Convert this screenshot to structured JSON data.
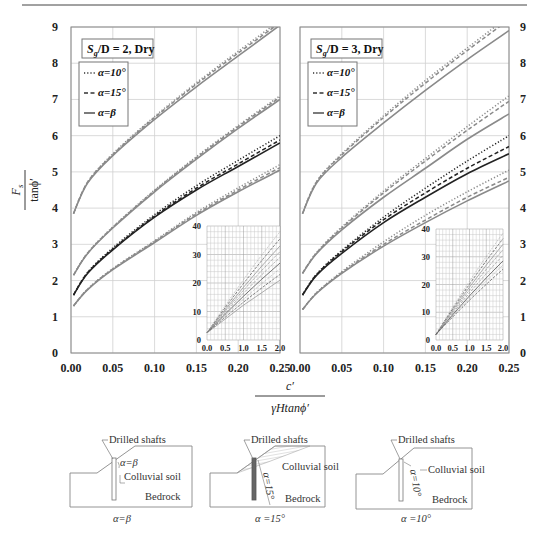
{
  "header_rule": true,
  "chart_data": [
    {
      "type": "line",
      "panel": "left",
      "title": "S_g/D = 2, Dry",
      "title_main": "S",
      "title_sub": "g",
      "title_rest": "/D = 2, Dry",
      "xlabel_num": "c′",
      "xlabel_den": "γHtanϕ′",
      "ylabel_num": "F_s",
      "ylabel_den": "tanϕ′",
      "xlim": [
        0,
        0.25
      ],
      "ylim": [
        0,
        9
      ],
      "xticks": [
        "0.00",
        "0.05",
        "0.10",
        "0.15",
        "0.20",
        "0.25"
      ],
      "yticks": [
        "0",
        "1",
        "2",
        "3",
        "4",
        "5",
        "6",
        "7",
        "8",
        "9"
      ],
      "grid": true,
      "legend": {
        "position": "upper-left",
        "items": [
          {
            "label": "α=10°",
            "style": "dotted"
          },
          {
            "label": "α=15°",
            "style": "dashed"
          },
          {
            "label": "α=β",
            "style": "solid"
          }
        ]
      },
      "x": [
        0.003,
        0.02,
        0.05,
        0.1,
        0.15,
        0.2,
        0.25
      ],
      "groups": [
        {
          "name": "curve-1",
          "color": "#8a8a8a",
          "series": [
            {
              "name": "α=β",
              "style": "solid",
              "values": [
                3.85,
                4.7,
                5.45,
                6.45,
                7.35,
                8.2,
                9.05
              ]
            },
            {
              "name": "α=15°",
              "style": "dashed",
              "values": [
                3.85,
                4.72,
                5.48,
                6.5,
                7.42,
                8.28,
                9.12
              ]
            },
            {
              "name": "α=10°",
              "style": "dotted",
              "values": [
                3.85,
                4.72,
                5.5,
                6.53,
                7.46,
                8.33,
                9.18
              ]
            }
          ]
        },
        {
          "name": "curve-2",
          "color": "#8a8a8a",
          "series": [
            {
              "name": "α=β",
              "style": "solid",
              "values": [
                2.15,
                2.75,
                3.45,
                4.45,
                5.35,
                6.2,
                7.0
              ]
            },
            {
              "name": "α=15°",
              "style": "dashed",
              "values": [
                2.15,
                2.76,
                3.47,
                4.48,
                5.39,
                6.25,
                7.06
              ]
            },
            {
              "name": "α=10°",
              "style": "dotted",
              "values": [
                2.15,
                2.77,
                3.48,
                4.5,
                5.42,
                6.28,
                7.1
              ]
            }
          ]
        },
        {
          "name": "curve-3",
          "color": "#222222",
          "series": [
            {
              "name": "α=β",
              "style": "solid",
              "values": [
                1.6,
                2.2,
                2.85,
                3.75,
                4.5,
                5.15,
                5.8
              ]
            },
            {
              "name": "α=15°",
              "style": "dashed",
              "values": [
                1.6,
                2.22,
                2.87,
                3.78,
                4.55,
                5.22,
                5.88
              ]
            },
            {
              "name": "α=10°",
              "style": "dotted",
              "values": [
                1.6,
                2.23,
                2.9,
                3.82,
                4.62,
                5.32,
                6.0
              ]
            }
          ]
        },
        {
          "name": "curve-4",
          "color": "#8a8a8a",
          "series": [
            {
              "name": "α=β",
              "style": "solid",
              "values": [
                1.3,
                1.75,
                2.3,
                3.05,
                3.8,
                4.45,
                5.05
              ]
            },
            {
              "name": "α=15°",
              "style": "dashed",
              "values": [
                1.3,
                1.76,
                2.32,
                3.08,
                3.84,
                4.5,
                5.12
              ]
            },
            {
              "name": "α=10°",
              "style": "dotted",
              "values": [
                1.3,
                1.77,
                2.33,
                3.1,
                3.88,
                4.56,
                5.2
              ]
            }
          ]
        }
      ],
      "inset": {
        "xlim": [
          0,
          2.0
        ],
        "ylim": [
          0,
          40
        ],
        "xticks": [
          "0.0",
          "0.5",
          "1.0",
          "1.5",
          "2.0"
        ],
        "yticks": [
          "0",
          "10",
          "20",
          "30",
          "40"
        ],
        "grid": "fine",
        "line_ends": [
          38,
          35.5,
          33,
          31,
          29,
          27,
          25,
          23,
          21
        ],
        "line_start": 2.5
      }
    },
    {
      "type": "line",
      "panel": "right",
      "title": "S_g/D = 3, Dry",
      "title_main": "S",
      "title_sub": "g",
      "title_rest": "/D = 3, Dry",
      "xlim": [
        0,
        0.25
      ],
      "ylim": [
        0,
        9
      ],
      "xticks": [
        "0.00",
        "0.05",
        "0.10",
        "0.15",
        "0.20",
        "0.25"
      ],
      "yticks": [
        "0",
        "1",
        "2",
        "3",
        "4",
        "5",
        "6",
        "7",
        "8",
        "9"
      ],
      "grid": true,
      "legend": {
        "position": "upper-left",
        "items": [
          {
            "label": "α=10°",
            "style": "dotted"
          },
          {
            "label": "α=15°",
            "style": "dashed"
          },
          {
            "label": "α=β",
            "style": "solid"
          }
        ]
      },
      "x": [
        0.003,
        0.02,
        0.05,
        0.1,
        0.15,
        0.2,
        0.25
      ],
      "groups": [
        {
          "name": "curve-1",
          "color": "#8a8a8a",
          "series": [
            {
              "name": "α=β",
              "style": "solid",
              "values": [
                3.85,
                4.7,
                5.4,
                6.35,
                7.25,
                8.1,
                8.9
              ]
            },
            {
              "name": "α=15°",
              "style": "dashed",
              "values": [
                3.85,
                4.73,
                5.47,
                6.5,
                7.45,
                8.35,
                9.2
              ]
            },
            {
              "name": "α=10°",
              "style": "dotted",
              "values": [
                3.85,
                4.74,
                5.5,
                6.55,
                7.52,
                8.42,
                9.3
              ]
            }
          ]
        },
        {
          "name": "curve-2",
          "color": "#8a8a8a",
          "series": [
            {
              "name": "α=β",
              "style": "solid",
              "values": [
                2.2,
                2.75,
                3.4,
                4.3,
                5.1,
                5.9,
                6.6
              ]
            },
            {
              "name": "α=15°",
              "style": "dashed",
              "values": [
                2.2,
                2.77,
                3.45,
                4.42,
                5.3,
                6.15,
                6.95
              ]
            },
            {
              "name": "α=10°",
              "style": "dotted",
              "values": [
                2.2,
                2.78,
                3.48,
                4.47,
                5.37,
                6.25,
                7.1
              ]
            }
          ]
        },
        {
          "name": "curve-3",
          "color": "#222222",
          "series": [
            {
              "name": "α=β",
              "style": "solid",
              "values": [
                1.6,
                2.15,
                2.75,
                3.6,
                4.3,
                4.95,
                5.5
              ]
            },
            {
              "name": "α=15°",
              "style": "dashed",
              "values": [
                1.6,
                2.17,
                2.8,
                3.68,
                4.42,
                5.1,
                5.7
              ]
            },
            {
              "name": "α=10°",
              "style": "dotted",
              "values": [
                1.6,
                2.18,
                2.83,
                3.75,
                4.55,
                5.3,
                6.0
              ]
            }
          ]
        },
        {
          "name": "curve-4",
          "color": "#8a8a8a",
          "series": [
            {
              "name": "α=β",
              "style": "solid",
              "values": [
                1.2,
                1.65,
                2.2,
                2.95,
                3.6,
                4.2,
                4.75
              ]
            },
            {
              "name": "α=15°",
              "style": "dashed",
              "values": [
                1.2,
                1.66,
                2.22,
                3.0,
                3.67,
                4.3,
                4.85
              ]
            },
            {
              "name": "α=10°",
              "style": "dotted",
              "values": [
                1.2,
                1.67,
                2.25,
                3.07,
                3.8,
                4.45,
                5.05
              ]
            }
          ]
        }
      ],
      "inset": {
        "xlim": [
          0,
          2.0
        ],
        "ylim": [
          0,
          40
        ],
        "xticks": [
          "0.0",
          "0.5",
          "1.0",
          "1.5",
          "2.0"
        ],
        "yticks": [
          "0",
          "10",
          "20",
          "30",
          "40"
        ],
        "grid": "fine",
        "line_ends": [
          38.5,
          36.5,
          34.5,
          32.5,
          30.5,
          28.5,
          27,
          25.5
        ],
        "line_start": 2.0
      }
    }
  ],
  "axes": {
    "ylabel_num_main": "F",
    "ylabel_num_sub": "s",
    "ylabel_den": "tanϕ′",
    "xlabel_num": "c′",
    "xlabel_den": "γHtanϕ′"
  },
  "diagrams": [
    {
      "name": "alpha-beta",
      "shafts_label": "Drilled shafts",
      "angle_label": "α=β",
      "soil_label": "Colluvial soil",
      "rock_label": "Bedrock",
      "caption": "α=β"
    },
    {
      "name": "alpha-15",
      "shafts_label": "Drilled shafts",
      "angle_label": "α=15°",
      "soil_label": "Colluvial soil",
      "rock_label": "Bedrock",
      "caption": "α =15°"
    },
    {
      "name": "alpha-10",
      "shafts_label": "Drilled shafts",
      "angle_label": "α=10°",
      "soil_label": "Colluvial soil",
      "rock_label": "Bedrock",
      "caption": "α =10°"
    }
  ]
}
